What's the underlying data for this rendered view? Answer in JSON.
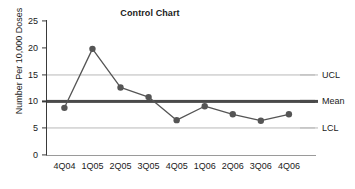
{
  "chart_data": {
    "type": "line",
    "title": "Control Chart",
    "xlabel": "",
    "ylabel": "Number Per 10,000 Doses",
    "categories": [
      "4Q04",
      "1Q05",
      "2Q05",
      "3Q05",
      "4Q05",
      "1Q06",
      "2Q06",
      "3Q06",
      "4Q06"
    ],
    "values": [
      8.8,
      19.8,
      12.6,
      10.8,
      6.5,
      9.1,
      7.6,
      6.4,
      7.6
    ],
    "series": [
      {
        "name": "Rate Per 10,000 Doses",
        "values": [
          8.8,
          19.8,
          12.6,
          10.8,
          6.5,
          9.1,
          7.6,
          6.4,
          7.6
        ]
      }
    ],
    "ylim": [
      0,
      25
    ],
    "yticks": [
      0,
      5,
      10,
      15,
      20,
      25
    ],
    "ytick_labels": [
      "0",
      "5",
      "10",
      "15",
      "20",
      "25"
    ],
    "grid": false,
    "legend_position": "right",
    "reference_lines": [
      {
        "key": "ucl",
        "label": "UCL",
        "value": 15,
        "style": "light",
        "color": "#b9b9b9"
      },
      {
        "key": "mean",
        "label": "Mean",
        "value": 10,
        "style": "dark",
        "color": "#4a4a4a"
      },
      {
        "key": "lcl",
        "label": "LCL",
        "value": 5,
        "style": "light",
        "color": "#b9b9b9"
      }
    ],
    "marker_color": "#555555",
    "line_color": "#555555"
  }
}
